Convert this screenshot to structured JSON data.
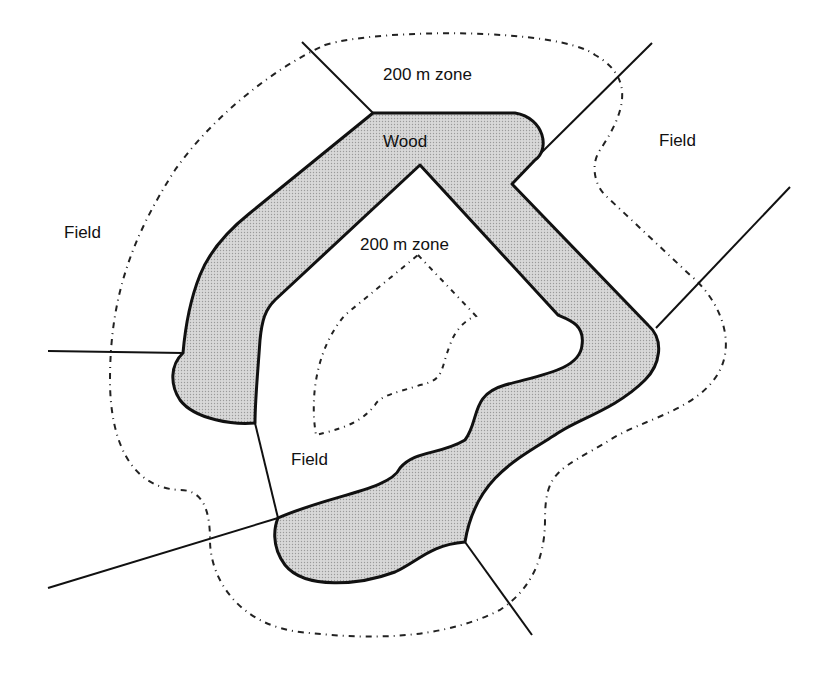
{
  "diagram": {
    "type": "land-use map diagram",
    "labels": {
      "zone_top": "200 m zone",
      "wood": "Wood",
      "field_right": "Field",
      "field_left": "Field",
      "zone_inner": "200 m zone",
      "field_bottom": "Field"
    },
    "colors": {
      "background": "#ffffff",
      "wood_fill": "#d4d4d4",
      "outline": "#111111",
      "zone_line": "#222222"
    },
    "legend_semantics": {
      "wood": "shaded area bounded by thick line",
      "field_boundaries": "thin solid lines",
      "zone_boundary": "dash-dot line 200 m from wood edge"
    }
  }
}
